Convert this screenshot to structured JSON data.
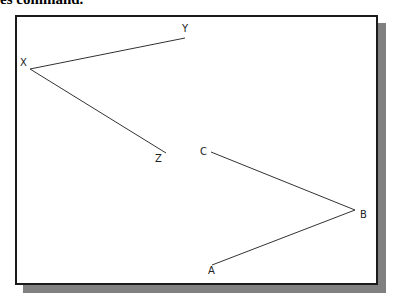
{
  "caption": "es command.",
  "diagram": {
    "polylines": [
      {
        "name": "XYZ",
        "points": [
          [
            185,
            38
          ],
          [
            30,
            69
          ],
          [
            166,
            153
          ]
        ]
      },
      {
        "name": "ABC",
        "points": [
          [
            211,
            152
          ],
          [
            355,
            210
          ],
          [
            212,
            265
          ]
        ]
      }
    ],
    "labels": [
      {
        "text": "Y",
        "x": 182,
        "y": 32
      },
      {
        "text": "X",
        "x": 20,
        "y": 66
      },
      {
        "text": "Z",
        "x": 155,
        "y": 162
      },
      {
        "text": "C",
        "x": 200,
        "y": 155
      },
      {
        "text": "B",
        "x": 360,
        "y": 218
      },
      {
        "text": "A",
        "x": 208,
        "y": 274
      }
    ]
  }
}
